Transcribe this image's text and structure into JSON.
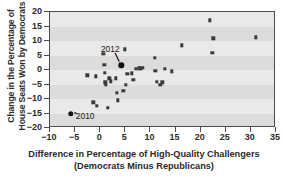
{
  "chart_data": {
    "type": "scatter",
    "title": "",
    "xlabel": "Difference in Percentage of High-Quality Challengers (Democrats Minus Republicans)",
    "xlabel_line1": "Difference in Percentage of High-Quality Challengers",
    "xlabel_line2": "(Democrats Minus Republicans)",
    "ylabel": "Change in the Percentage of House Seats Won by Democrats",
    "ylabel_line1": "Change in the Percentage of",
    "ylabel_line2": "House Seats Won by Democrats",
    "xlim": [
      -10,
      35
    ],
    "ylim": [
      -20,
      20
    ],
    "xticks": [
      -10,
      -5,
      0,
      5,
      10,
      15,
      20,
      25,
      30,
      35
    ],
    "yticks": [
      -20,
      -15,
      -10,
      -5,
      0,
      5,
      10,
      15,
      20
    ],
    "xtick_labels": [
      "−10",
      "−5",
      "0",
      "5",
      "10",
      "15",
      "20",
      "25",
      "30",
      "35"
    ],
    "ytick_labels": [
      "−20",
      "−15",
      "−10",
      "−5",
      "0",
      "5",
      "10",
      "15",
      "20"
    ],
    "grid": false,
    "banded_background": true,
    "legend": null,
    "marker": "square",
    "marker_color": "#3a3a3a",
    "plot_bg": "#e9e9e9",
    "band_color": "#dcdcdc",
    "points": [
      {
        "x": -5.9,
        "y": -15.1,
        "label": "2010",
        "highlight": true
      },
      {
        "x": 4.2,
        "y": 1.6,
        "label": "2012",
        "highlight": true
      },
      {
        "x": -2.6,
        "y": -1.8,
        "label": "",
        "highlight": false
      },
      {
        "x": -1.4,
        "y": -11.2,
        "label": "",
        "highlight": false
      },
      {
        "x": -0.9,
        "y": -2.2,
        "label": "",
        "highlight": false
      },
      {
        "x": -0.7,
        "y": -12.4,
        "label": "",
        "highlight": false
      },
      {
        "x": 0.6,
        "y": 5.6,
        "label": "",
        "highlight": false
      },
      {
        "x": 0.8,
        "y": 1.7,
        "label": "",
        "highlight": false
      },
      {
        "x": 0.9,
        "y": -0.9,
        "label": "",
        "highlight": false
      },
      {
        "x": 1.0,
        "y": -4.3,
        "label": "",
        "highlight": false
      },
      {
        "x": 1.1,
        "y": -5.1,
        "label": "",
        "highlight": false
      },
      {
        "x": 1.5,
        "y": -13.0,
        "label": "",
        "highlight": false
      },
      {
        "x": 1.8,
        "y": -2.8,
        "label": "",
        "highlight": false
      },
      {
        "x": 2.1,
        "y": -3.9,
        "label": "",
        "highlight": false
      },
      {
        "x": 3.1,
        "y": -2.9,
        "label": "",
        "highlight": false
      },
      {
        "x": 3.3,
        "y": -7.9,
        "label": "",
        "highlight": false
      },
      {
        "x": 3.5,
        "y": -10.4,
        "label": "",
        "highlight": false
      },
      {
        "x": 4.6,
        "y": -7.1,
        "label": "",
        "highlight": false
      },
      {
        "x": 4.9,
        "y": 7.2,
        "label": "",
        "highlight": false
      },
      {
        "x": 5.1,
        "y": -5.0,
        "label": "",
        "highlight": false
      },
      {
        "x": 5.4,
        "y": -1.3,
        "label": "",
        "highlight": false
      },
      {
        "x": 6.3,
        "y": -1.1,
        "label": "",
        "highlight": false
      },
      {
        "x": 6.6,
        "y": -3.4,
        "label": "",
        "highlight": false
      },
      {
        "x": 7.1,
        "y": 0.5,
        "label": "",
        "highlight": false
      },
      {
        "x": 7.7,
        "y": 0.6,
        "label": "",
        "highlight": false
      },
      {
        "x": 8.1,
        "y": 0.6,
        "label": "",
        "highlight": false
      },
      {
        "x": 8.5,
        "y": 0.7,
        "label": "",
        "highlight": false
      },
      {
        "x": 10.9,
        "y": 4.2,
        "label": "",
        "highlight": false
      },
      {
        "x": 11.0,
        "y": -0.2,
        "label": "",
        "highlight": false
      },
      {
        "x": 11.3,
        "y": -4.0,
        "label": "",
        "highlight": false
      },
      {
        "x": 12.0,
        "y": -5.2,
        "label": "",
        "highlight": false
      },
      {
        "x": 12.4,
        "y": -4.2,
        "label": "",
        "highlight": false
      },
      {
        "x": 12.9,
        "y": 0.4,
        "label": "",
        "highlight": false
      },
      {
        "x": 14.2,
        "y": -0.5,
        "label": "",
        "highlight": false
      },
      {
        "x": 16.3,
        "y": 8.5,
        "label": "",
        "highlight": false
      },
      {
        "x": 21.8,
        "y": 17.2,
        "label": "",
        "highlight": false
      },
      {
        "x": 22.3,
        "y": 6.0,
        "label": "",
        "highlight": false
      },
      {
        "x": 22.5,
        "y": 10.9,
        "label": "",
        "highlight": false
      },
      {
        "x": 31.0,
        "y": 11.3,
        "label": "",
        "highlight": false
      }
    ],
    "annotations": [
      {
        "text": "2012",
        "label_x": 2.0,
        "label_y": 7.4,
        "point_x": 4.2,
        "point_y": 1.6
      },
      {
        "text": "2010",
        "label_x": -3.0,
        "label_y": -16.0,
        "point_x": -5.9,
        "point_y": -15.1
      }
    ]
  }
}
